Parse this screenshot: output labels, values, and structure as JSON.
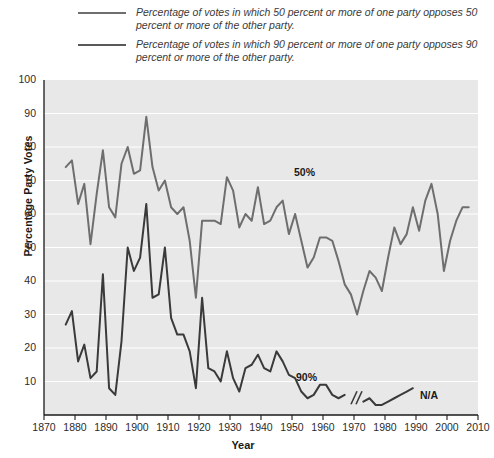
{
  "chart_data": {
    "type": "line",
    "title": "",
    "xlabel": "Year",
    "ylabel": "Percentage Party Votes",
    "xlim": [
      1870,
      2010
    ],
    "ylim": [
      0,
      100
    ],
    "ytick_labels": [
      "10",
      "20",
      "30",
      "40",
      "50",
      "60",
      "70",
      "80",
      "90",
      "100"
    ],
    "ytick_values": [
      10,
      20,
      30,
      40,
      50,
      60,
      70,
      80,
      90,
      100
    ],
    "xtick_labels": [
      "1870",
      "1880",
      "1890",
      "1900",
      "1910",
      "1920",
      "1930",
      "1940",
      "1950",
      "1960",
      "1970",
      "1980",
      "1990",
      "2000",
      "2010"
    ],
    "xtick_values": [
      1870,
      1880,
      1890,
      1900,
      1910,
      1920,
      1930,
      1940,
      1950,
      1960,
      1970,
      1980,
      1990,
      2000,
      2010
    ],
    "grid": "horizontal",
    "legend_position": "above-plot",
    "plot_background": "#e8e8e8",
    "gridline_color": "#ffffff",
    "series": [
      {
        "name": "50-percent-series",
        "label": "Percentage of votes in which 50 percent or more of one party opposes 50 percent or more of the other party.",
        "color": "#6e6e6e",
        "inline_label": "50%",
        "x": [
          1877,
          1879,
          1881,
          1883,
          1885,
          1887,
          1889,
          1891,
          1893,
          1895,
          1897,
          1899,
          1901,
          1903,
          1905,
          1907,
          1909,
          1911,
          1913,
          1915,
          1917,
          1919,
          1921,
          1923,
          1925,
          1927,
          1929,
          1931,
          1933,
          1935,
          1937,
          1939,
          1941,
          1943,
          1945,
          1947,
          1949,
          1951,
          1953,
          1955,
          1957,
          1959,
          1961,
          1963,
          1965,
          1967,
          1969,
          1971,
          1973,
          1975,
          1977,
          1979,
          1981,
          1983,
          1985,
          1987,
          1989,
          1991,
          1993,
          1995,
          1997,
          1999,
          2001,
          2003,
          2005,
          2007
        ],
        "y": [
          74,
          76,
          63,
          69,
          51,
          66,
          79,
          62,
          59,
          75,
          80,
          72,
          73,
          89,
          74,
          67,
          70,
          62,
          60,
          62,
          52,
          35,
          58,
          58,
          58,
          57,
          71,
          67,
          56,
          60,
          58,
          68,
          57,
          58,
          62,
          64,
          54,
          60,
          52,
          44,
          47,
          53,
          53,
          52,
          46,
          39,
          36,
          30,
          37,
          43,
          41,
          37,
          47,
          56,
          51,
          54,
          62,
          55,
          64,
          69,
          60,
          43,
          52,
          58,
          62,
          62
        ]
      },
      {
        "name": "90-percent-series",
        "label": "Percentage of votes in which 90 percent or more of one party opposes 90 percent or more of the other party.",
        "color": "#3a3a3a",
        "inline_label": "90%",
        "break_note": "N/A",
        "segment_1_x": [
          1877,
          1879,
          1881,
          1883,
          1885,
          1887,
          1889,
          1891,
          1893,
          1895,
          1897,
          1899,
          1901,
          1903,
          1905,
          1907,
          1909,
          1911,
          1913,
          1915,
          1917,
          1919,
          1921,
          1923,
          1925,
          1927,
          1929,
          1931,
          1933,
          1935,
          1937,
          1939,
          1941,
          1943,
          1945,
          1947,
          1949,
          1951,
          1953,
          1955,
          1957,
          1959,
          1961,
          1963,
          1965,
          1967
        ],
        "segment_1_y": [
          27,
          31,
          16,
          21,
          11,
          13,
          42,
          8,
          6,
          22,
          50,
          43,
          47,
          63,
          35,
          36,
          50,
          29,
          24,
          24,
          19,
          8,
          35,
          14,
          13,
          10,
          19,
          11,
          7,
          14,
          15,
          18,
          14,
          13,
          19,
          16,
          12,
          11,
          7,
          5,
          6,
          9,
          9,
          6,
          5,
          6
        ],
        "segment_2_x": [
          1973,
          1975,
          1977,
          1979,
          1981,
          1983,
          1985,
          1987,
          1989
        ],
        "segment_2_y": [
          4,
          5,
          3,
          3,
          4,
          5,
          6,
          7,
          8
        ]
      }
    ]
  }
}
